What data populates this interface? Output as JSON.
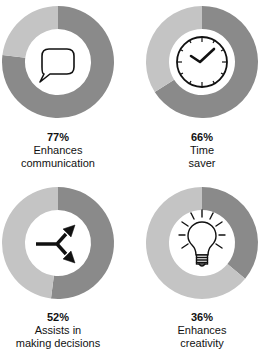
{
  "colors": {
    "value": "#8a8a8a",
    "remainder": "#c4c4c4",
    "hole": "#ffffff",
    "icon": "#111111"
  },
  "chart_data": {
    "type": "pie",
    "subtype": "donut-grid",
    "title": "",
    "series": [
      {
        "name": "Enhances communication",
        "value": 77,
        "label": "77%",
        "icon": "speech-bubble-icon"
      },
      {
        "name": "Time saver",
        "value": 66,
        "label": "66%",
        "icon": "clock-icon"
      },
      {
        "name": "Assists in making decisions",
        "value": 52,
        "label": "52%",
        "icon": "branching-arrows-icon"
      },
      {
        "name": "Enhances creativity",
        "value": 36,
        "label": "36%",
        "icon": "light-bulb-icon"
      }
    ],
    "layout": {
      "rows": 2,
      "cols": 2,
      "legend": "none",
      "grid": false
    }
  },
  "panels": [
    {
      "pct": "77%",
      "line1": "Enhances",
      "line2": "communication"
    },
    {
      "pct": "66%",
      "line1": "Time",
      "line2": "saver"
    },
    {
      "pct": "52%",
      "line1": "Assists in",
      "line2": "making decisions"
    },
    {
      "pct": "36%",
      "line1": "Enhances",
      "line2": "creativity"
    }
  ]
}
